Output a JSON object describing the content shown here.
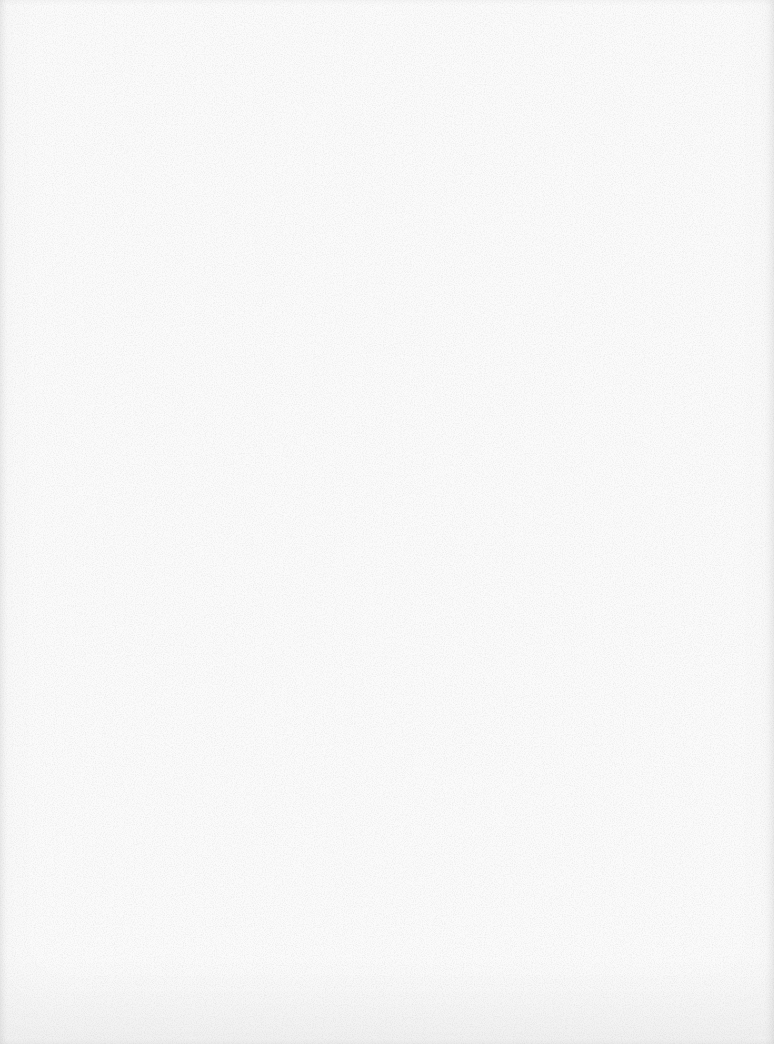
{
  "document": {
    "type": "blank-scanned-page",
    "content": "",
    "colors": {
      "paper": "#fbfbfb",
      "grain": "#9a9a9a"
    }
  }
}
